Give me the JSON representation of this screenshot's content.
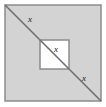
{
  "figure": {
    "type": "geometry-diagram",
    "canvas": {
      "width": 106,
      "height": 107,
      "background": "#ffffff"
    },
    "outer_square": {
      "name": "outer-square",
      "x": 5,
      "y": 5,
      "size": 96,
      "fill": "#d3d3d3",
      "stroke": "#8c8c8c",
      "stroke_width": 1.5
    },
    "inner_square": {
      "name": "inner-square",
      "x": 40,
      "y": 40,
      "size": 29,
      "fill": "#ffffff",
      "stroke": "#8c8c8c",
      "stroke_width": 1.5
    },
    "diagonal": {
      "name": "diagonal-line",
      "x1": 5,
      "y1": 5,
      "x2": 101,
      "y2": 101,
      "stroke": "#6e6e6e",
      "stroke_width": 1.6
    },
    "labels": [
      {
        "id": "outer-upper",
        "text": "x",
        "x": 28,
        "y": 15
      },
      {
        "id": "inner",
        "text": "x",
        "x": 54,
        "y": 45
      },
      {
        "id": "outer-lower",
        "text": "x",
        "x": 82,
        "y": 74
      }
    ]
  }
}
